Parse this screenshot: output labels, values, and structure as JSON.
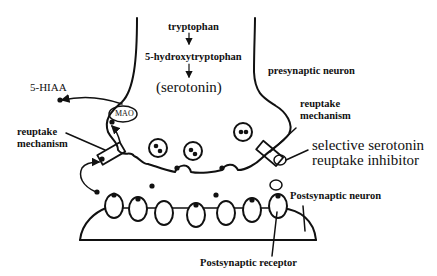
{
  "diagram": {
    "labels": {
      "tryptophan": "tryptophan",
      "hydroxytryptophan": "5-hydroxytryptophan",
      "serotonin": "(serotonin)",
      "presynaptic_neuron": "presynaptic neuron",
      "hiaa": "5-HIAA",
      "mao": "MAO",
      "reuptake_left_line1": "reuptake",
      "reuptake_left_line2": "mechanism",
      "reuptake_right_line1": "reuptake",
      "reuptake_right_line2": "mechanism",
      "ssri_line1": "selective serotonin",
      "ssri_line2": "reuptake inhibitor",
      "postsynaptic_neuron": "Postsynaptic neuron",
      "postsynaptic_receptor": "Postsynaptic receptor"
    },
    "pathway": [
      "tryptophan",
      "5-hydroxytryptophan",
      "(serotonin)"
    ],
    "colors": {
      "ink": "#111111",
      "background": "#ffffff"
    }
  }
}
